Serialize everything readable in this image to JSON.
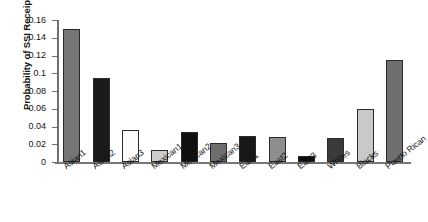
{
  "chart_data": {
    "type": "bar",
    "title": "",
    "subtitle": "",
    "xlabel": "",
    "ylabel": "Probability of SSI Receipt",
    "ylim": [
      0,
      0.16
    ],
    "yticks": [
      "0",
      "0.02",
      "0.04",
      "0.06",
      "0.08",
      "0.1",
      "0.12",
      "0.14",
      "0.16"
    ],
    "ytick_values": [
      0,
      0.02,
      0.04,
      0.06,
      0.08,
      0.1,
      0.12,
      0.14,
      0.16
    ],
    "grid": false,
    "legend": "none",
    "categories": [
      "Asian1",
      "Asian2",
      "Asian3",
      "Mexican1",
      "Mexican2",
      "Mexican3",
      "East1",
      "East2",
      "East3",
      "Whites",
      "Blacks",
      "Puerto Rican"
    ],
    "values": [
      0.15,
      0.095,
      0.036,
      0.013,
      0.034,
      0.021,
      0.029,
      0.028,
      0.007,
      0.027,
      0.06,
      0.115
    ],
    "bar_colors": [
      "#767676",
      "#1a1a1a",
      "#fbfbfb",
      "#cccccc",
      "#101010",
      "#6e6e6e",
      "#181818",
      "#8e8e8e",
      "#0d0d0d",
      "#3a3a3a",
      "#c9c9c9",
      "#6f6f6f"
    ],
    "axis_color": "#6f6f6f",
    "bar_edge_color": "#2b2b2b",
    "background": "#ffffff"
  }
}
